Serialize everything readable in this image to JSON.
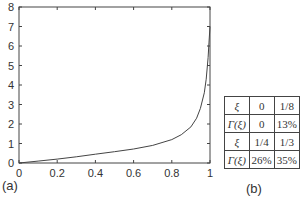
{
  "chart_data": {
    "type": "line",
    "title": "",
    "xlabel": "",
    "ylabel": "",
    "xlim": [
      0,
      1
    ],
    "ylim": [
      0,
      8
    ],
    "x_ticks": [
      "0",
      "0.2",
      "0.4",
      "0.6",
      "0.8",
      "1"
    ],
    "y_ticks": [
      "0",
      "1",
      "2",
      "3",
      "4",
      "5",
      "6",
      "7",
      "8"
    ],
    "grid": false,
    "series": [
      {
        "name": "curve",
        "x": [
          0,
          0.1,
          0.2,
          0.3,
          0.4,
          0.5,
          0.6,
          0.7,
          0.8,
          0.85,
          0.9,
          0.93,
          0.95,
          0.97,
          0.98,
          0.99,
          0.995,
          1.0
        ],
        "y": [
          0,
          0.1,
          0.2,
          0.32,
          0.45,
          0.58,
          0.72,
          0.9,
          1.2,
          1.45,
          1.85,
          2.3,
          2.8,
          3.6,
          4.3,
          5.4,
          6.2,
          7.0
        ]
      }
    ]
  },
  "labels": {
    "panel_a": "(a)",
    "panel_b": "(b)"
  },
  "table": {
    "rows": [
      [
        "ξ",
        "0",
        "1/8"
      ],
      [
        "Γ(ξ)",
        "0",
        "13%"
      ],
      [
        "ξ",
        "1/4",
        "1/3"
      ],
      [
        "Γ(ξ)",
        "26%",
        "35%"
      ]
    ]
  }
}
